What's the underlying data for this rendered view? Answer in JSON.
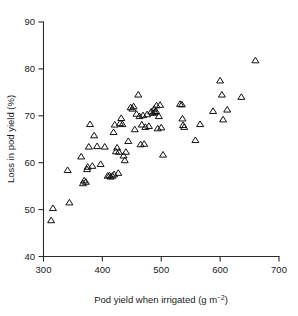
{
  "figure": {
    "background_color": "#ffffff",
    "marker_symbol": "open-triangle-up",
    "marker_color": "#111111"
  },
  "chart_data": {
    "type": "scatter",
    "title": "",
    "xlabel": "Pod yield when irrigated (g m⁻²)",
    "xlabel_main": "Pod yield when irrigated (g m",
    "xlabel_sup": "−2",
    "xlabel_tail": ")",
    "ylabel": "Loss in pod yield (%)",
    "xlim": [
      300,
      700
    ],
    "ylim": [
      40,
      90
    ],
    "xticks": [
      300,
      400,
      500,
      600,
      700
    ],
    "yticks": [
      40,
      50,
      60,
      70,
      80,
      90
    ],
    "xtick_labels": [
      "300",
      "400",
      "500",
      "600",
      "700"
    ],
    "ytick_labels": [
      "40",
      "50",
      "60",
      "70",
      "80",
      "90"
    ],
    "grid": false,
    "legend": false,
    "series_name": "Pod yield loss",
    "n_points": 76,
    "points": [
      [
        313,
        47.7
      ],
      [
        316,
        50.3
      ],
      [
        344,
        51.5
      ],
      [
        341,
        58.4
      ],
      [
        364,
        61.3
      ],
      [
        367,
        55.6
      ],
      [
        369,
        56.2
      ],
      [
        372,
        55.9
      ],
      [
        374,
        58.6
      ],
      [
        375,
        59.1
      ],
      [
        377,
        63.4
      ],
      [
        379,
        68.2
      ],
      [
        383,
        59.3
      ],
      [
        386,
        65.8
      ],
      [
        391,
        63.5
      ],
      [
        397,
        59.7
      ],
      [
        404,
        63.4
      ],
      [
        409,
        57.2
      ],
      [
        412,
        57.3
      ],
      [
        414,
        57.0
      ],
      [
        417,
        57.2
      ],
      [
        419,
        66.5
      ],
      [
        420,
        57.5
      ],
      [
        421,
        68.1
      ],
      [
        423,
        62.4
      ],
      [
        425,
        63.2
      ],
      [
        427,
        57.8
      ],
      [
        428,
        62.3
      ],
      [
        430,
        68.4
      ],
      [
        432,
        69.5
      ],
      [
        434,
        68.2
      ],
      [
        436,
        61.5
      ],
      [
        438,
        60.5
      ],
      [
        440,
        62.3
      ],
      [
        444,
        64.6
      ],
      [
        448,
        71.8
      ],
      [
        451,
        71.5
      ],
      [
        453,
        72.0
      ],
      [
        455,
        67.1
      ],
      [
        458,
        70.4
      ],
      [
        461,
        74.5
      ],
      [
        463,
        69.9
      ],
      [
        465,
        63.9
      ],
      [
        467,
        68.1
      ],
      [
        469,
        70.1
      ],
      [
        471,
        64.0
      ],
      [
        473,
        67.6
      ],
      [
        476,
        70.3
      ],
      [
        479,
        67.8
      ],
      [
        483,
        70.9
      ],
      [
        486,
        70.6
      ],
      [
        488,
        71.5
      ],
      [
        489,
        70.8
      ],
      [
        491,
        71.0
      ],
      [
        492,
        72.2
      ],
      [
        494,
        67.3
      ],
      [
        496,
        69.9
      ],
      [
        498,
        72.3
      ],
      [
        500,
        67.5
      ],
      [
        503,
        61.7
      ],
      [
        532,
        72.5
      ],
      [
        535,
        72.4
      ],
      [
        536,
        69.4
      ],
      [
        537,
        68.0
      ],
      [
        539,
        67.6
      ],
      [
        558,
        64.8
      ],
      [
        566,
        68.2
      ],
      [
        588,
        71.0
      ],
      [
        600,
        77.5
      ],
      [
        603,
        74.5
      ],
      [
        605,
        69.2
      ],
      [
        612,
        71.3
      ],
      [
        636,
        74.0
      ],
      [
        660,
        81.8
      ]
    ]
  }
}
